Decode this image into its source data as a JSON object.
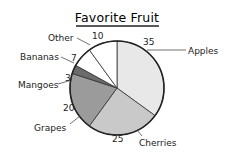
{
  "chart_data": {
    "type": "pie",
    "title": "Favorite Fruit",
    "categories": [
      "Apples",
      "Cherries",
      "Grapes",
      "Mangoes",
      "Bananas",
      "Other"
    ],
    "values": [
      35,
      25,
      20,
      3,
      7,
      10
    ],
    "colors": [
      "#e8e8e8",
      "#c9c9c9",
      "#9b9b9b",
      "#6b6b6b",
      "#ffffff",
      "#ffffff"
    ],
    "start_angle": "12 o'clock",
    "direction": "clockwise",
    "total": 100,
    "legend": "none (direct labels with leader lines)"
  },
  "labels": {
    "title": "Favorite Fruit",
    "apples": "Apples",
    "apples_value": "35",
    "cherries": "Cherries",
    "cherries_value": "25",
    "grapes": "Grapes",
    "grapes_value": "20",
    "mangoes": "Mangoes",
    "mangoes_value": "3",
    "bananas": "Bananas",
    "bananas_value": "7",
    "other": "Other",
    "other_value": "10"
  }
}
